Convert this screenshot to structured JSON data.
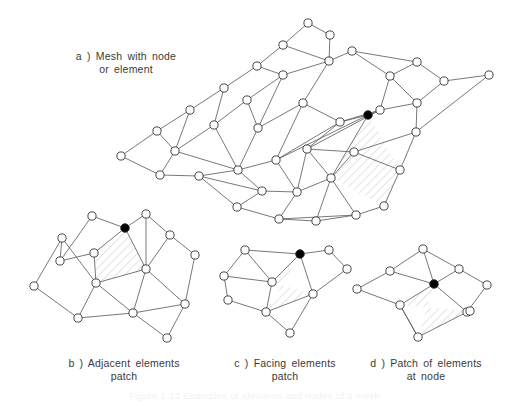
{
  "figure": {
    "caption": "Figure 1.12 Examples of elements and nodes of a mesh",
    "panels": [
      {
        "id": "a",
        "label": "a )  Mesh  with  node\nor element"
      },
      {
        "id": "b",
        "label": "b )  Adjacent  elements\npatch"
      },
      {
        "id": "c",
        "label": "c )  Facing  elements\npatch"
      },
      {
        "id": "d",
        "label": "d ) Patch of elements\nat node"
      }
    ]
  },
  "style": {
    "edge_color": "#555555",
    "node_stroke": "#333333",
    "node_fill": "#ffffff",
    "highlight_node_fill": "#000000",
    "hatch_color": "#d8d8d8",
    "background": "#ffffff",
    "node_radius": 4.1,
    "highlight_radius": 4.3,
    "edge_width": 0.8
  },
  "chart_data": {
    "type": "diagram",
    "title": "Examples of elements and nodes of a mesh",
    "panel_a": {
      "name": "Mesh with node or element",
      "highlight_node": "n31",
      "hatched_elements": [
        [
          "n31",
          "n37",
          "n38",
          "n32"
        ]
      ],
      "nodes": {
        "n1": [
          121,
          156
        ],
        "n2": [
          157,
          131
        ],
        "n3": [
          190,
          110
        ],
        "n4": [
          224,
          88
        ],
        "n5": [
          257,
          66
        ],
        "n6": [
          283,
          45
        ],
        "n7": [
          308,
          23
        ],
        "n8": [
          330,
          35
        ],
        "n9": [
          329,
          61
        ],
        "n10": [
          283,
          75
        ],
        "n11": [
          247,
          100
        ],
        "n12": [
          214,
          125
        ],
        "n13": [
          175,
          151
        ],
        "n14": [
          160,
          175
        ],
        "n15": [
          199,
          176
        ],
        "n16": [
          238,
          170
        ],
        "n17": [
          276,
          160
        ],
        "n18": [
          258,
          128
        ],
        "n19": [
          303,
          103
        ],
        "n20": [
          352,
          51
        ],
        "n21": [
          390,
          76
        ],
        "n22": [
          417,
          62
        ],
        "n23": [
          444,
          81
        ],
        "n24": [
          489,
          75
        ],
        "n25": [
          417,
          103
        ],
        "n26": [
          380,
          110
        ],
        "n27": [
          340,
          122
        ],
        "n28": [
          307,
          149
        ],
        "n29": [
          354,
          152
        ],
        "n30": [
          416,
          132
        ],
        "n31": [
          368,
          115
        ],
        "n32": [
          331,
          178
        ],
        "n33": [
          297,
          192
        ],
        "n34": [
          262,
          191
        ],
        "n35": [
          237,
          207
        ],
        "n36": [
          279,
          219
        ],
        "n37": [
          400,
          170
        ],
        "n38": [
          384,
          206
        ],
        "n39": [
          356,
          215
        ],
        "n40": [
          316,
          221
        ]
      },
      "edges": [
        [
          "n1",
          "n2"
        ],
        [
          "n2",
          "n3"
        ],
        [
          "n3",
          "n4"
        ],
        [
          "n4",
          "n5"
        ],
        [
          "n5",
          "n6"
        ],
        [
          "n6",
          "n7"
        ],
        [
          "n7",
          "n8"
        ],
        [
          "n8",
          "n9"
        ],
        [
          "n9",
          "n10"
        ],
        [
          "n6",
          "n9"
        ],
        [
          "n5",
          "n10"
        ],
        [
          "n10",
          "n11"
        ],
        [
          "n11",
          "n12"
        ],
        [
          "n12",
          "n13"
        ],
        [
          "n13",
          "n14"
        ],
        [
          "n14",
          "n1"
        ],
        [
          "n3",
          "n13"
        ],
        [
          "n4",
          "n12"
        ],
        [
          "n2",
          "n13"
        ],
        [
          "n14",
          "n15"
        ],
        [
          "n15",
          "n16"
        ],
        [
          "n16",
          "n17"
        ],
        [
          "n13",
          "n16"
        ],
        [
          "n12",
          "n16"
        ],
        [
          "n11",
          "n18"
        ],
        [
          "n18",
          "n16"
        ],
        [
          "n10",
          "n18"
        ],
        [
          "n18",
          "n19"
        ],
        [
          "n19",
          "n9"
        ],
        [
          "n9",
          "n20"
        ],
        [
          "n20",
          "n21"
        ],
        [
          "n21",
          "n22"
        ],
        [
          "n22",
          "n23"
        ],
        [
          "n23",
          "n24"
        ],
        [
          "n24",
          "n30"
        ],
        [
          "n30",
          "n25"
        ],
        [
          "n25",
          "n23"
        ],
        [
          "n25",
          "n21"
        ],
        [
          "n21",
          "n26"
        ],
        [
          "n26",
          "n25"
        ],
        [
          "n26",
          "n27"
        ],
        [
          "n27",
          "n19"
        ],
        [
          "n19",
          "n17"
        ],
        [
          "n17",
          "n27"
        ],
        [
          "n17",
          "n31"
        ],
        [
          "n31",
          "n27"
        ],
        [
          "n31",
          "n26"
        ],
        [
          "n27",
          "n28"
        ],
        [
          "n28",
          "n26"
        ],
        [
          "n28",
          "n29"
        ],
        [
          "n29",
          "n30"
        ],
        [
          "n29",
          "n37"
        ],
        [
          "n30",
          "n37"
        ],
        [
          "n37",
          "n38"
        ],
        [
          "n38",
          "n39"
        ],
        [
          "n39",
          "n32"
        ],
        [
          "n32",
          "n29"
        ],
        [
          "n31",
          "n32"
        ],
        [
          "n28",
          "n32"
        ],
        [
          "n17",
          "n33"
        ],
        [
          "n33",
          "n32"
        ],
        [
          "n33",
          "n28"
        ],
        [
          "n16",
          "n34"
        ],
        [
          "n34",
          "n33"
        ],
        [
          "n34",
          "n35"
        ],
        [
          "n35",
          "n36"
        ],
        [
          "n36",
          "n33"
        ],
        [
          "n36",
          "n40"
        ],
        [
          "n40",
          "n32"
        ],
        [
          "n40",
          "n39"
        ],
        [
          "n36",
          "n39"
        ],
        [
          "n15",
          "n34"
        ],
        [
          "n35",
          "n15"
        ],
        [
          "n20",
          "n22"
        ]
      ]
    },
    "panel_b": {
      "name": "Adjacent elements patch",
      "highlight_node": "b5",
      "hatched_elements": [
        [
          "b5",
          "b4",
          "b8",
          "b9"
        ]
      ],
      "nodes": {
        "b1": [
          34,
          286
        ],
        "b2": [
          60,
          261
        ],
        "b3": [
          62,
          238
        ],
        "b4": [
          94,
          253
        ],
        "b5": [
          125,
          228
        ],
        "b6": [
          92,
          216
        ],
        "b7": [
          146,
          214
        ],
        "b8": [
          96,
          283
        ],
        "b9": [
          146,
          269
        ],
        "b10": [
          170,
          235
        ],
        "b11": [
          195,
          255
        ],
        "b12": [
          78,
          318
        ],
        "b13": [
          133,
          313
        ],
        "b14": [
          185,
          304
        ],
        "b15": [
          167,
          338
        ]
      },
      "edges": [
        [
          "b1",
          "b3"
        ],
        [
          "b3",
          "b2"
        ],
        [
          "b2",
          "b6"
        ],
        [
          "b6",
          "b5"
        ],
        [
          "b5",
          "b7"
        ],
        [
          "b7",
          "b10"
        ],
        [
          "b10",
          "b11"
        ],
        [
          "b11",
          "b14"
        ],
        [
          "b14",
          "b15"
        ],
        [
          "b15",
          "b13"
        ],
        [
          "b13",
          "b12"
        ],
        [
          "b12",
          "b1"
        ],
        [
          "b2",
          "b4"
        ],
        [
          "b4",
          "b5"
        ],
        [
          "b4",
          "b8"
        ],
        [
          "b8",
          "b9"
        ],
        [
          "b9",
          "b5"
        ],
        [
          "b9",
          "b10"
        ],
        [
          "b3",
          "b8"
        ],
        [
          "b8",
          "b12"
        ],
        [
          "b8",
          "b13"
        ],
        [
          "b9",
          "b13"
        ],
        [
          "b9",
          "b14"
        ],
        [
          "b13",
          "b14"
        ],
        [
          "b7",
          "b9"
        ]
      ]
    },
    "panel_c": {
      "name": "Facing elements patch",
      "highlight_node": "c4",
      "hatched_elements": [
        [
          "c4",
          "c3",
          "c6",
          "c7"
        ]
      ],
      "nodes": {
        "c1": [
          224,
          276
        ],
        "c2": [
          245,
          250
        ],
        "c3": [
          272,
          282
        ],
        "c4": [
          300,
          254
        ],
        "c5": [
          329,
          250
        ],
        "c6": [
          313,
          294
        ],
        "c7": [
          266,
          312
        ],
        "c8": [
          228,
          300
        ],
        "c9": [
          347,
          269
        ],
        "c10": [
          290,
          333
        ]
      },
      "edges": [
        [
          "c1",
          "c2"
        ],
        [
          "c2",
          "c4"
        ],
        [
          "c4",
          "c5"
        ],
        [
          "c5",
          "c9"
        ],
        [
          "c9",
          "c6"
        ],
        [
          "c6",
          "c10"
        ],
        [
          "c10",
          "c7"
        ],
        [
          "c7",
          "c8"
        ],
        [
          "c8",
          "c1"
        ],
        [
          "c1",
          "c3"
        ],
        [
          "c3",
          "c4"
        ],
        [
          "c3",
          "c7"
        ],
        [
          "c7",
          "c6"
        ],
        [
          "c4",
          "c6"
        ],
        [
          "c2",
          "c3"
        ]
      ]
    },
    "panel_d": {
      "name": "Patch of elements at node",
      "highlight_node": "d5",
      "hatched_elements": [
        [
          "d5",
          "d6",
          "d10",
          "d9"
        ]
      ],
      "nodes": {
        "d1": [
          357,
          289
        ],
        "d2": [
          390,
          271
        ],
        "d3": [
          423,
          249
        ],
        "d4": [
          459,
          269
        ],
        "d5": [
          434,
          284
        ],
        "d6": [
          400,
          305
        ],
        "d7": [
          487,
          285
        ],
        "d8": [
          467,
          312
        ],
        "d9": [
          418,
          337
        ],
        "d10": [
          470,
          311
        ]
      },
      "edges": [
        [
          "d1",
          "d2"
        ],
        [
          "d2",
          "d3"
        ],
        [
          "d3",
          "d4"
        ],
        [
          "d4",
          "d7"
        ],
        [
          "d7",
          "d8"
        ],
        [
          "d8",
          "d9"
        ],
        [
          "d9",
          "d6"
        ],
        [
          "d6",
          "d1"
        ],
        [
          "d2",
          "d5"
        ],
        [
          "d3",
          "d5"
        ],
        [
          "d4",
          "d5"
        ],
        [
          "d5",
          "d6"
        ],
        [
          "d5",
          "d8"
        ],
        [
          "d6",
          "d9"
        ]
      ]
    }
  }
}
